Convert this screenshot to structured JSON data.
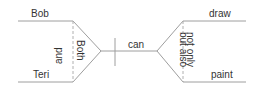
{
  "diagram": {
    "type": "sentence-diagram",
    "colors": {
      "line": "#9e9e9e",
      "dash": "#b0b0b0",
      "text": "#333333",
      "background": "#ffffff"
    },
    "subjects": {
      "top": "Bob",
      "bottom": "Teri",
      "conjunction_left": "and",
      "conjunction_right": "Both"
    },
    "verb": "can",
    "predicates": {
      "top": "draw",
      "bottom": "paint",
      "conjunction_left": "but also",
      "conjunction_right": "not only"
    }
  }
}
